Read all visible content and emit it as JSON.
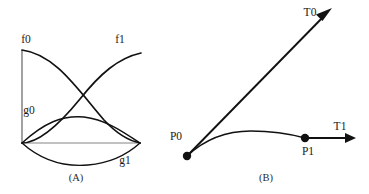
{
  "figure": {
    "background_color": "#ffffff",
    "ink_color": "#111111",
    "baseline_color": "#777777",
    "width": 369,
    "height": 194
  },
  "panel_a": {
    "caption": "(A)",
    "caption_pos": {
      "x": 76,
      "y": 181
    },
    "labels": [
      {
        "id": "f0",
        "text": "f0",
        "x": 26,
        "y": 43
      },
      {
        "id": "f1",
        "text": "f1",
        "x": 120,
        "y": 43
      },
      {
        "id": "g0",
        "text": "g0",
        "x": 29,
        "y": 114
      },
      {
        "id": "g1",
        "text": "g1",
        "x": 125,
        "y": 164
      }
    ],
    "axis": {
      "x": 22,
      "y_top": 50,
      "y_bottom": 144
    },
    "baseline": {
      "x0": 22,
      "x1": 141,
      "y": 143
    },
    "curves": [
      {
        "id": "f0",
        "name": "f0-curve",
        "path": "M 22,50 C 55,54 78,90 104,120 C 118,135 130,141 140,143"
      },
      {
        "id": "f1",
        "name": "f1-curve",
        "path": "M 22,143 C 38,143 58,126 80,99 C 100,74 118,58 141,53"
      },
      {
        "id": "g0",
        "name": "g0-curve",
        "path": "M 22,143 C 44,123 62,115 84,117 C 108,120 126,134 140,143"
      },
      {
        "id": "g1",
        "name": "g1-curve",
        "path": "M 22,143 C 42,161 64,167 88,165 C 112,163 130,152 140,143"
      }
    ]
  },
  "panel_b": {
    "caption": "(B)",
    "caption_pos": {
      "x": 266,
      "y": 181
    },
    "labels": [
      {
        "id": "T0",
        "text": "T0",
        "x": 310,
        "y": 16
      },
      {
        "id": "T1",
        "text": "T1",
        "x": 340,
        "y": 130
      },
      {
        "id": "P0",
        "text": "P0",
        "x": 176,
        "y": 140
      },
      {
        "id": "P1",
        "text": "P1",
        "x": 308,
        "y": 155
      }
    ],
    "points": [
      {
        "id": "P0",
        "name": "p0-point",
        "x": 187,
        "y": 156,
        "r": 4.2
      },
      {
        "id": "P1",
        "name": "p1-point",
        "x": 305,
        "y": 138,
        "r": 4.2
      }
    ],
    "vectors": [
      {
        "id": "T0",
        "name": "t0-vector",
        "x0": 187,
        "y0": 156,
        "x1": 326,
        "y1": 14,
        "arrow": "M 332,8 L 317,15 L 323,21 Z"
      },
      {
        "id": "T1",
        "name": "t1-vector",
        "x0": 305,
        "y0": 138,
        "x1": 349,
        "y1": 138,
        "arrow": "M 356,138 L 345,133 L 345,143 Z"
      }
    ],
    "curve": {
      "id": "bezier",
      "name": "bezier-curve",
      "path": "M 187,156 C 204,140 226,131 251,131 C 276,131 294,135 305,138"
    }
  }
}
